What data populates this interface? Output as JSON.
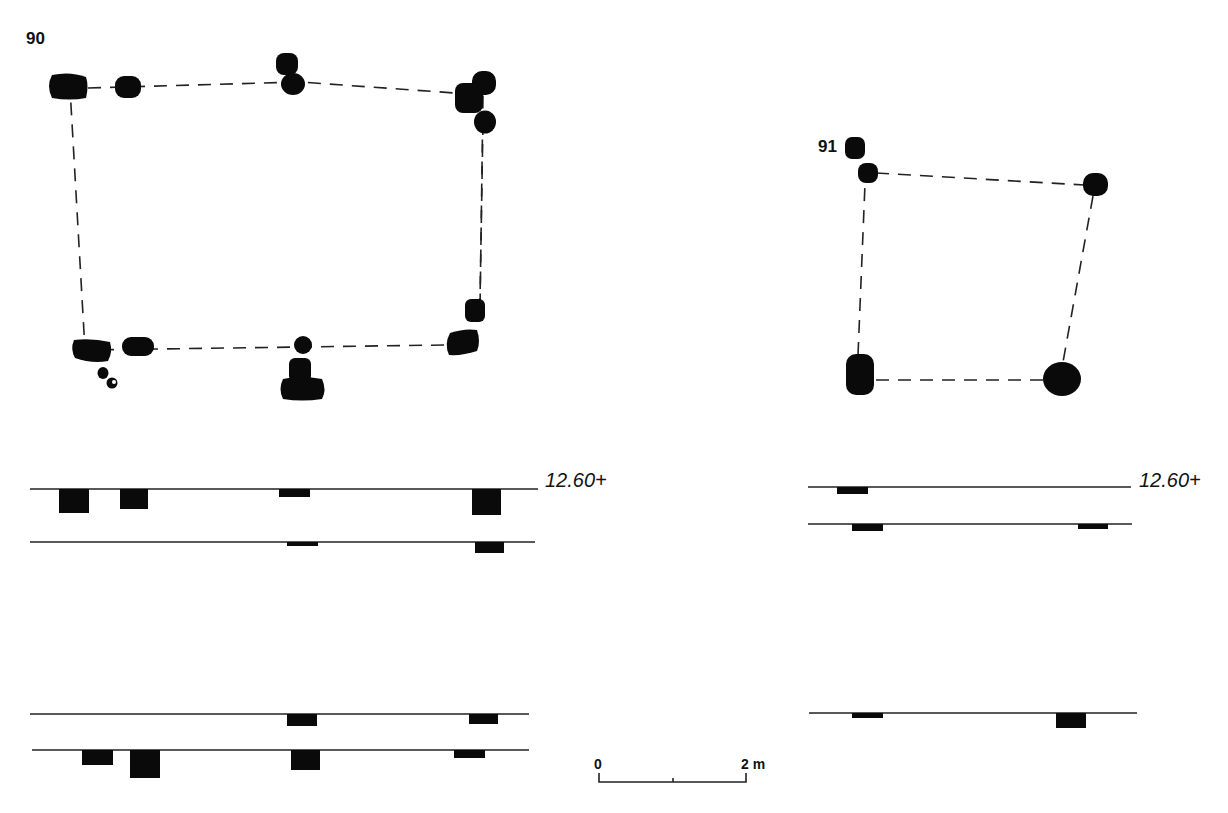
{
  "figure": {
    "type": "archaeological plan and section drawing",
    "background": "#ffffff",
    "ink_color": "#0a0a0a"
  },
  "structures": [
    {
      "id": "90",
      "label": "90",
      "plan": {
        "outline": "dashed quadrilateral",
        "corners": [
          [
            70,
            88
          ],
          [
            300,
            82
          ],
          [
            483,
            95
          ],
          [
            444,
            345
          ],
          [
            85,
            350
          ]
        ],
        "stones": [
          {
            "x": 48,
            "y": 73,
            "w": 40,
            "h": 27,
            "shape": "rounded-block"
          },
          {
            "x": 115,
            "y": 76,
            "w": 26,
            "h": 22,
            "shape": "rounded"
          },
          {
            "x": 276,
            "y": 53,
            "w": 22,
            "h": 22,
            "shape": "rounded"
          },
          {
            "x": 281,
            "y": 72,
            "w": 24,
            "h": 22,
            "shape": "round"
          },
          {
            "x": 455,
            "y": 83,
            "w": 28,
            "h": 30,
            "shape": "rounded-block"
          },
          {
            "x": 472,
            "y": 71,
            "w": 24,
            "h": 24,
            "shape": "rounded"
          },
          {
            "x": 474,
            "y": 111,
            "w": 22,
            "h": 23,
            "shape": "round"
          },
          {
            "x": 465,
            "y": 299,
            "w": 20,
            "h": 23,
            "shape": "rounded"
          },
          {
            "x": 446,
            "y": 330,
            "w": 34,
            "h": 25,
            "shape": "rounded-block"
          },
          {
            "x": 71,
            "y": 339,
            "w": 41,
            "h": 24,
            "shape": "rounded-block"
          },
          {
            "x": 122,
            "y": 337,
            "w": 32,
            "h": 19,
            "shape": "rounded"
          },
          {
            "x": 294,
            "y": 336,
            "w": 18,
            "h": 18,
            "shape": "round"
          },
          {
            "x": 289,
            "y": 358,
            "w": 22,
            "h": 22,
            "shape": "rounded"
          },
          {
            "x": 279,
            "y": 377,
            "w": 46,
            "h": 24,
            "shape": "rounded-block"
          },
          {
            "x": 98,
            "y": 367,
            "w": 11,
            "h": 12,
            "shape": "small-round"
          },
          {
            "x": 106,
            "y": 377,
            "w": 11,
            "h": 11,
            "shape": "small-round-hollow"
          }
        ]
      },
      "sections": [
        {
          "name": "upper-pair",
          "elevation_label": "12.60+",
          "lines": [
            {
              "y": 489,
              "x1": 30,
              "x2": 538,
              "blocks": [
                {
                  "x": 59,
                  "w": 30,
                  "depth": 24
                },
                {
                  "x": 120,
                  "w": 28,
                  "depth": 20
                },
                {
                  "x": 279,
                  "w": 31,
                  "depth": 8
                },
                {
                  "x": 472,
                  "w": 29,
                  "depth": 26
                }
              ]
            },
            {
              "y": 542,
              "x1": 30,
              "x2": 535,
              "blocks": [
                {
                  "x": 287,
                  "w": 31,
                  "depth": 4
                },
                {
                  "x": 475,
                  "w": 29,
                  "depth": 11
                }
              ]
            }
          ]
        },
        {
          "name": "lower-pair",
          "lines": [
            {
              "y": 714,
              "x1": 30,
              "x2": 529,
              "blocks": [
                {
                  "x": 287,
                  "w": 30,
                  "depth": 12
                },
                {
                  "x": 469,
                  "w": 29,
                  "depth": 10
                }
              ]
            },
            {
              "y": 750,
              "x1": 32,
              "x2": 529,
              "blocks": [
                {
                  "x": 82,
                  "w": 31,
                  "depth": 15
                },
                {
                  "x": 130,
                  "w": 30,
                  "depth": 28
                },
                {
                  "x": 291,
                  "w": 29,
                  "depth": 20
                },
                {
                  "x": 454,
                  "w": 31,
                  "depth": 8
                }
              ]
            }
          ]
        }
      ]
    },
    {
      "id": "91",
      "label": "91",
      "plan": {
        "outline": "dashed quadrilateral",
        "corners": [
          [
            866,
            172
          ],
          [
            1095,
            185
          ],
          [
            1063,
            380
          ],
          [
            858,
            380
          ]
        ],
        "stones": [
          {
            "x": 845,
            "y": 137,
            "w": 20,
            "h": 22,
            "shape": "rounded"
          },
          {
            "x": 858,
            "y": 163,
            "w": 20,
            "h": 20,
            "shape": "round"
          },
          {
            "x": 1083,
            "y": 173,
            "w": 25,
            "h": 23,
            "shape": "round"
          },
          {
            "x": 846,
            "y": 354,
            "w": 28,
            "h": 41,
            "shape": "rounded-block"
          },
          {
            "x": 1043,
            "y": 362,
            "w": 38,
            "h": 34,
            "shape": "round"
          }
        ]
      },
      "sections": [
        {
          "name": "upper-pair",
          "elevation_label": "12.60+",
          "lines": [
            {
              "y": 487,
              "x1": 808,
              "x2": 1131,
              "blocks": [
                {
                  "x": 837,
                  "w": 31,
                  "depth": 7
                }
              ]
            },
            {
              "y": 524,
              "x1": 808,
              "x2": 1132,
              "blocks": [
                {
                  "x": 852,
                  "w": 31,
                  "depth": 7
                },
                {
                  "x": 1078,
                  "w": 30,
                  "depth": 5
                }
              ]
            }
          ]
        },
        {
          "name": "lower",
          "lines": [
            {
              "y": 713,
              "x1": 809,
              "x2": 1137,
              "blocks": [
                {
                  "x": 852,
                  "w": 31,
                  "depth": 5
                },
                {
                  "x": 1056,
                  "w": 30,
                  "depth": 15
                }
              ]
            }
          ]
        }
      ]
    }
  ],
  "scale_bar": {
    "start_label": "0",
    "end_label": "2 m",
    "x1": 599,
    "x2": 746,
    "y": 782
  }
}
